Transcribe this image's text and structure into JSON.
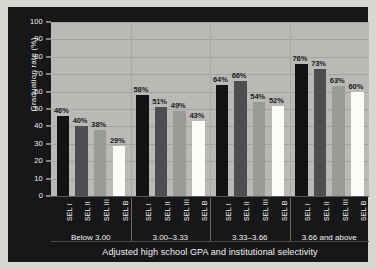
{
  "chart_data": {
    "type": "bar",
    "title": "",
    "xlabel": "Adjusted high school GPA and institutional selectivity",
    "ylabel": "Graduation rate (%)",
    "ylim": [
      0,
      100
    ],
    "ytick_values": [
      0,
      10,
      20,
      30,
      40,
      50,
      60,
      70,
      80,
      90,
      100
    ],
    "ytick_labels": [
      "0",
      "10",
      "20",
      "30",
      "40",
      "50",
      "60",
      "70",
      "80",
      "90",
      "100"
    ],
    "grid": true,
    "legend": "none",
    "groups": [
      "Below 3.00",
      "3.00–3.33",
      "3.33–3.66",
      "3.66 and above"
    ],
    "categories": [
      "SEL I",
      "SEL II",
      "SEL III",
      "SEL B"
    ],
    "series": [
      {
        "name": "SEL I",
        "color": "#131316",
        "values": [
          46,
          58,
          64,
          76
        ],
        "labels": [
          "46%",
          "58%",
          "64%",
          "76%"
        ]
      },
      {
        "name": "SEL II",
        "color": "#4e4e52",
        "values": [
          40,
          51,
          66,
          73
        ],
        "labels": [
          "40%",
          "51%",
          "66%",
          "73%"
        ]
      },
      {
        "name": "SEL III",
        "color": "#9a9b96",
        "values": [
          38,
          49,
          54,
          63
        ],
        "labels": [
          "38%",
          "49%",
          "54%",
          "63%"
        ]
      },
      {
        "name": "SEL B",
        "color": "#fbfbf7",
        "values": [
          29,
          43,
          52,
          60
        ],
        "labels": [
          "29%",
          "43%",
          "52%",
          "60%"
        ]
      }
    ],
    "bars_flat": [
      {
        "group": "Below 3.00",
        "category": "SEL I",
        "value": 46,
        "label": "46%",
        "series_class": "sel1"
      },
      {
        "group": "Below 3.00",
        "category": "SEL II",
        "value": 40,
        "label": "40%",
        "series_class": "sel2"
      },
      {
        "group": "Below 3.00",
        "category": "SEL III",
        "value": 38,
        "label": "38%",
        "series_class": "sel3"
      },
      {
        "group": "Below 3.00",
        "category": "SEL B",
        "value": 29,
        "label": "29%",
        "series_class": "selb"
      },
      {
        "group": "3.00–3.33",
        "category": "SEL I",
        "value": 58,
        "label": "58%",
        "series_class": "sel1"
      },
      {
        "group": "3.00–3.33",
        "category": "SEL II",
        "value": 51,
        "label": "51%",
        "series_class": "sel2"
      },
      {
        "group": "3.00–3.33",
        "category": "SEL III",
        "value": 49,
        "label": "49%",
        "series_class": "sel3"
      },
      {
        "group": "3.00–3.33",
        "category": "SEL B",
        "value": 43,
        "label": "43%",
        "series_class": "selb"
      },
      {
        "group": "3.33–3.66",
        "category": "SEL I",
        "value": 64,
        "label": "64%",
        "series_class": "sel1"
      },
      {
        "group": "3.33–3.66",
        "category": "SEL II",
        "value": 66,
        "label": "66%",
        "series_class": "sel2"
      },
      {
        "group": "3.33–3.66",
        "category": "SEL III",
        "value": 54,
        "label": "54%",
        "series_class": "sel3"
      },
      {
        "group": "3.33–3.66",
        "category": "SEL B",
        "value": 52,
        "label": "52%",
        "series_class": "selb"
      },
      {
        "group": "3.66 and above",
        "category": "SEL I",
        "value": 76,
        "label": "76%",
        "series_class": "sel1"
      },
      {
        "group": "3.66 and above",
        "category": "SEL II",
        "value": 73,
        "label": "73%",
        "series_class": "sel2"
      },
      {
        "group": "3.66 and above",
        "category": "SEL III",
        "value": 63,
        "label": "63%",
        "series_class": "sel3"
      },
      {
        "group": "3.66 and above",
        "category": "SEL B",
        "value": 60,
        "label": "60%",
        "series_class": "selb"
      }
    ]
  },
  "colors": {
    "panel_background": "#17171a",
    "plot_background": "#b9bab5",
    "gridline": "#a3a49f",
    "axis_text": "#f2f2ee",
    "value_text": "#1a1a1c",
    "page_background": "#d6d6d2"
  }
}
